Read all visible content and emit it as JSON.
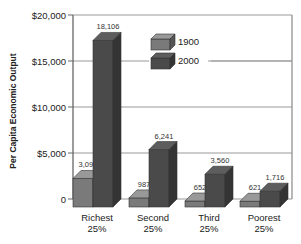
{
  "chart_data": {
    "type": "bar",
    "title": "",
    "xlabel": "",
    "ylabel": "Per Capita Economic Output",
    "ylim": [
      0,
      20000
    ],
    "yticks": [
      0,
      5000,
      10000,
      15000,
      20000
    ],
    "ytick_labels": [
      "0",
      "$5,000",
      "$10,000",
      "$15,000",
      "$20,000"
    ],
    "categories": [
      "Richest 25%",
      "Second 25%",
      "Third 25%",
      "Poorest 25%"
    ],
    "category_lines": [
      [
        "Richest",
        "25%"
      ],
      [
        "Second",
        "25%"
      ],
      [
        "Third",
        "25%"
      ],
      [
        "Poorest",
        "25%"
      ]
    ],
    "series": [
      {
        "name": "1900",
        "values": [
          3098,
          987,
          652,
          621
        ],
        "labels": [
          "3,098",
          "987",
          "652",
          "621"
        ],
        "color": "#7a7a7a"
      },
      {
        "name": "2000",
        "values": [
          18106,
          6241,
          3560,
          1716
        ],
        "labels": [
          "18,106",
          "6,241",
          "3,560",
          "1,716"
        ],
        "color": "#4a4a4a"
      }
    ],
    "grid": true,
    "style": "3d",
    "legend_position": "upper-center"
  }
}
